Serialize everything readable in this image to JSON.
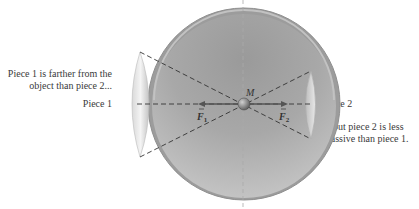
{
  "labels": {
    "piece1_far_line1": "Piece 1 is farther from the",
    "piece1_far_line2": "object than piece 2...",
    "piece1": "Piece 1",
    "piece2": "Piece 2",
    "piece2_less_line1": "... but piece 2 is less",
    "piece2_less_line2": "massive than piece 1.",
    "mass": "M",
    "force1": "F",
    "force1_sub": "1",
    "force2": "F",
    "force2_sub": "2"
  },
  "colors": {
    "shell_outer": "#8a8a8a",
    "shell_inner_dark": "#7d7d7d",
    "shell_inner_light": "#c8c8c8",
    "rim": "#b5b5b5",
    "cap_light": "#eeeeee",
    "dash": "#333333",
    "arrow": "#555555"
  },
  "diagram": {
    "force_relation": "F1 and F2 point in opposite directions and cancel"
  }
}
